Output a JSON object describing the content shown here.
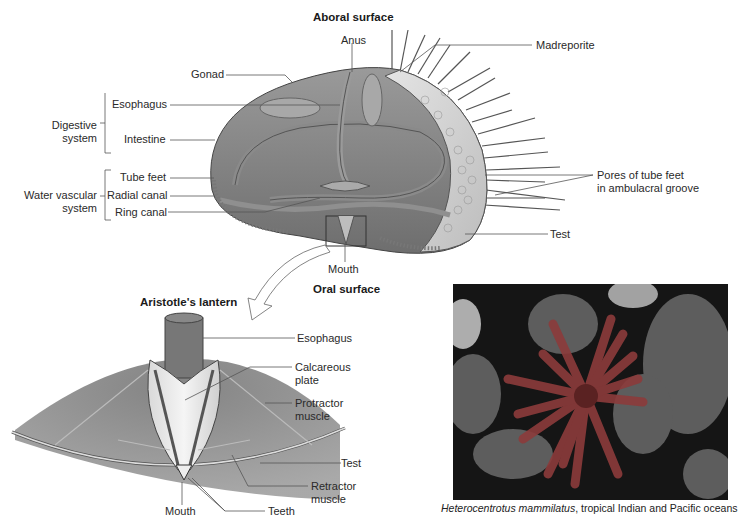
{
  "main_diagram": {
    "title_top": "Aboral surface",
    "title_bottom": "Oral surface",
    "labels": {
      "anus": "Anus",
      "madreporite": "Madreporite",
      "gonad": "Gonad",
      "esophagus": "Esophagus",
      "intestine": "Intestine",
      "tube_feet": "Tube feet",
      "radial_canal": "Radial canal",
      "ring_canal": "Ring canal",
      "pores_line1": "Pores of tube feet",
      "pores_line2": "in ambulacral groove",
      "test": "Test",
      "mouth": "Mouth"
    },
    "groups": {
      "digestive_line1": "Digestive",
      "digestive_line2": "system",
      "water_line1": "Water vascular",
      "water_line2": "system"
    }
  },
  "lantern_diagram": {
    "title": "Aristotle's lantern",
    "labels": {
      "esophagus": "Esophagus",
      "calcareous_line1": "Calcareous",
      "calcareous_line2": "plate",
      "protractor_line1": "Protractor",
      "protractor_line2": "muscle",
      "test": "Test",
      "retractor_line1": "Retractor",
      "retractor_line2": "muscle",
      "mouth": "Mouth",
      "teeth": "Teeth"
    }
  },
  "photo": {
    "caption_species": "Heterocentrotus mammilatus",
    "caption_rest": ", tropical Indian and Pacific oceans"
  }
}
